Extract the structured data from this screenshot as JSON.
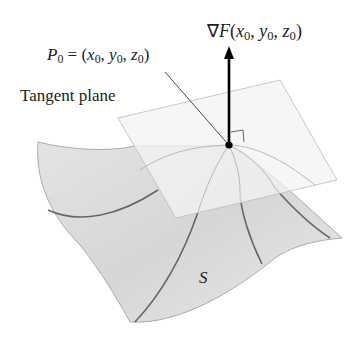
{
  "diagram": {
    "labels": {
      "gradient": "∇F(x0, y0, z0)",
      "gradient_parts": {
        "nabla": "∇",
        "f": "F",
        "open": "(",
        "x": "x",
        "y": "y",
        "z": "z",
        "sub": "0",
        "comma": ", ",
        "close": ")"
      },
      "point": "P0 = (x0, y0, z0)",
      "point_parts": {
        "p": "P",
        "eq": " = (",
        "x": "x",
        "y": "y",
        "z": "z",
        "sub": "0",
        "comma": ", ",
        "close": ")"
      },
      "tangent_plane": "Tangent plane",
      "surface": "S"
    },
    "colors": {
      "surface_fill": "#dcdcdc",
      "plane_fill": "#eeeeee",
      "curve": "#555555",
      "arrow": "#000000"
    }
  }
}
